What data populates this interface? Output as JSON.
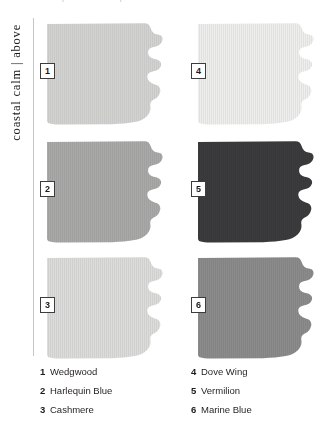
{
  "plate": {
    "top_cropped_text": "paint swatch plate",
    "side_caption": "coastal calm | above"
  },
  "swatches": [
    {
      "number": "1",
      "name": "Wedgwood",
      "color": "#d3d3d1",
      "column": "left",
      "row": 1
    },
    {
      "number": "2",
      "name": "Harlequin Blue",
      "color": "#a9a9a7",
      "column": "left",
      "row": 2
    },
    {
      "number": "3",
      "name": "Cashmere",
      "color": "#dcdcda",
      "column": "left",
      "row": 3
    },
    {
      "number": "4",
      "name": "Dove Wing",
      "color": "#eeeeec",
      "column": "right",
      "row": 1
    },
    {
      "number": "5",
      "name": "Vermilion",
      "color": "#3b3b3d",
      "column": "right",
      "row": 2
    },
    {
      "number": "6",
      "name": "Marine Blue",
      "color": "#8b8b8b",
      "column": "right",
      "row": 3
    }
  ],
  "legend": {
    "left_column": [
      {
        "number": "1",
        "name": "Wedgwood"
      },
      {
        "number": "2",
        "name": "Harlequin Blue"
      },
      {
        "number": "3",
        "name": "Cashmere"
      }
    ],
    "right_column": [
      {
        "number": "4",
        "name": "Dove Wing"
      },
      {
        "number": "5",
        "name": "Vermilion"
      },
      {
        "number": "6",
        "name": "Marine Blue"
      }
    ]
  },
  "colors": {
    "page_background": "#ffffff",
    "rule": "#c6c6c8",
    "text": "#231f20",
    "badge_border": "#3d3b3c",
    "badge_fill": "#ffffff"
  }
}
